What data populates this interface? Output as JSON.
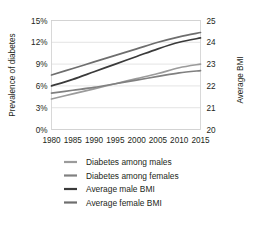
{
  "chart_data": {
    "type": "line",
    "title": "",
    "xlabel": "",
    "ylabel": "Prevalence of diabetes",
    "y2label": "Average BMI",
    "x": [
      1980,
      1985,
      1990,
      1995,
      2000,
      2005,
      2010,
      2015
    ],
    "xlim": [
      1980,
      2015
    ],
    "xticks": [
      1980,
      1985,
      1990,
      1995,
      2000,
      2005,
      2010,
      2015
    ],
    "xtick_labels": [
      "1980",
      "1985",
      "1990",
      "1995",
      "2000",
      "2005",
      "2010",
      "2015"
    ],
    "ylim": [
      0,
      15
    ],
    "yticks": [
      0,
      3,
      6,
      9,
      12,
      15
    ],
    "ytick_labels": [
      "0%",
      "3%",
      "6%",
      "9%",
      "12%",
      "15%"
    ],
    "y2lim": [
      20,
      25
    ],
    "y2ticks": [
      20,
      21,
      22,
      23,
      24,
      25
    ],
    "y2tick_labels": [
      "20",
      "21",
      "22",
      "23",
      "24",
      "25"
    ],
    "grid": true,
    "legend_position": "bottom",
    "series": [
      {
        "name": "Diabetes among males",
        "axis": "left",
        "unit": "%",
        "color": "#9b9b9b",
        "values": [
          4.2,
          4.9,
          5.6,
          6.3,
          7.0,
          7.7,
          8.5,
          9.0
        ]
      },
      {
        "name": "Diabetes among females",
        "axis": "left",
        "unit": "%",
        "color": "#808080",
        "values": [
          5.0,
          5.4,
          5.8,
          6.3,
          6.8,
          7.3,
          7.8,
          8.1
        ]
      },
      {
        "name": "Average male BMI",
        "axis": "right",
        "unit": "BMI",
        "color": "#3a3a3a",
        "values": [
          22.0,
          22.3,
          22.65,
          23.0,
          23.35,
          23.7,
          24.0,
          24.2
        ]
      },
      {
        "name": "Average female BMI",
        "axis": "right",
        "unit": "BMI",
        "color": "#6e6e6e",
        "values": [
          22.5,
          22.8,
          23.1,
          23.4,
          23.7,
          24.0,
          24.25,
          24.45
        ]
      }
    ]
  },
  "legend": {
    "items": [
      {
        "label": "Diabetes among males"
      },
      {
        "label": "Diabetes among females"
      },
      {
        "label": "Average male BMI"
      },
      {
        "label": "Average female BMI"
      }
    ]
  }
}
